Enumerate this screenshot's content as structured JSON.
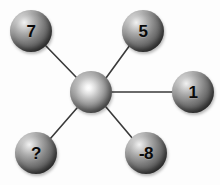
{
  "diagram": {
    "type": "star-hub-and-spoke",
    "background_color": "#fdfdfd",
    "line_color": "#3a3a3a",
    "node_fill_dark": "#2a2a2a",
    "node_fill_light": "#f2f2f2",
    "label_color": "#0a0a0a",
    "hub": {
      "name": "center-node",
      "label": "",
      "cx": 91,
      "cy": 92,
      "r": 21
    },
    "nodes": [
      {
        "name": "node-7",
        "label": "7",
        "cx": 31,
        "cy": 31,
        "r": 21,
        "position": "top-left"
      },
      {
        "name": "node-5",
        "label": "5",
        "cx": 143,
        "cy": 31,
        "r": 21,
        "position": "top-right"
      },
      {
        "name": "node-1",
        "label": "1",
        "cx": 193,
        "cy": 92,
        "r": 21,
        "position": "right"
      },
      {
        "name": "node--8",
        "label": "-8",
        "cx": 146,
        "cy": 153,
        "r": 21,
        "position": "bottom-right"
      },
      {
        "name": "node-?",
        "label": "?",
        "cx": 36,
        "cy": 153,
        "r": 21,
        "position": "bottom-left"
      }
    ],
    "edges": [
      {
        "name": "spoke-hub-to-7",
        "from": "center-node",
        "to": "node-7",
        "x1": 76,
        "y1": 77,
        "x2": 46,
        "y2": 46
      },
      {
        "name": "spoke-hub-to-5",
        "from": "center-node",
        "to": "node-5",
        "x1": 106,
        "y1": 78,
        "x2": 130,
        "y2": 45
      },
      {
        "name": "spoke-hub-to-1",
        "from": "center-node",
        "to": "node-1",
        "x1": 112,
        "y1": 92,
        "x2": 172,
        "y2": 92
      },
      {
        "name": "spoke-hub-to--8",
        "from": "center-node",
        "to": "node--8",
        "x1": 106,
        "y1": 107,
        "x2": 133,
        "y2": 139
      },
      {
        "name": "spoke-hub-to-?",
        "from": "center-node",
        "to": "node-?",
        "x1": 77,
        "y1": 108,
        "x2": 50,
        "y2": 139
      }
    ]
  }
}
